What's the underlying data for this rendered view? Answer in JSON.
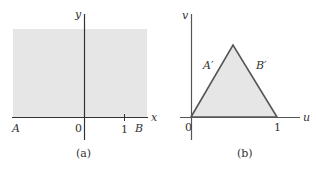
{
  "panel_a": {
    "caption": "(a)",
    "x_axis_label": "x",
    "y_axis_label": "y",
    "origin_label": "0",
    "tick_label": "1",
    "point_a_label": "A",
    "point_b_label": "B",
    "fill_color": "#e6e6e6",
    "axis_color": "#333333"
  },
  "panel_b": {
    "caption": "(b)",
    "u_axis_label": "u",
    "v_axis_label": "v",
    "origin_label": "0",
    "tick_label": "1",
    "edge_a_label": "A′",
    "edge_b_label": "B′",
    "fill_color": "#e6e6e6",
    "edge_color": "#555555"
  }
}
